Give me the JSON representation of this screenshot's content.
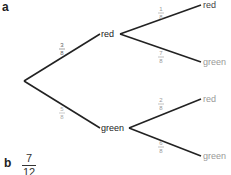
{
  "part_a": {
    "label": "a",
    "root": {
      "x": 24,
      "y": 81
    },
    "level1": [
      {
        "name": "red",
        "x": 100,
        "y": 34,
        "prob": "3/8",
        "label_x": 54,
        "label_y": 42,
        "prob_color": "#666"
      },
      {
        "name": "green",
        "x": 100,
        "y": 128,
        "prob": "5/8",
        "label_x": 54,
        "label_y": 106,
        "prob_color": "#aaa"
      }
    ],
    "level2": [
      {
        "parent": 0,
        "name": "red",
        "x": 203,
        "y": 5,
        "prob": "1/8",
        "label_x": 153,
        "label_y": 6,
        "text_color": "#444"
      },
      {
        "parent": 0,
        "name": "green",
        "x": 203,
        "y": 62,
        "prob": "7/8",
        "label_x": 153,
        "label_y": 50,
        "text_color": "#999"
      },
      {
        "parent": 1,
        "name": "red",
        "x": 203,
        "y": 99,
        "prob": "2/8",
        "label_x": 153,
        "label_y": 97,
        "text_color": "#999"
      },
      {
        "parent": 1,
        "name": "green",
        "x": 203,
        "y": 156,
        "prob": "6/8",
        "label_x": 153,
        "label_y": 140,
        "text_color": "#999"
      }
    ]
  },
  "part_b": {
    "label": "b",
    "numerator": "7",
    "denominator": "12"
  }
}
